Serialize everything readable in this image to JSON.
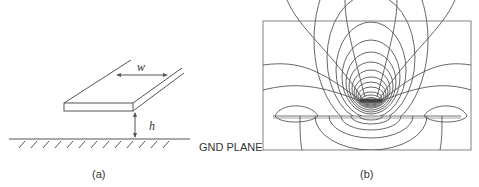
{
  "figure": {
    "panel_a": {
      "caption": "(a)",
      "width_label": "w",
      "height_label": "h"
    },
    "panel_b": {
      "caption": "(b)",
      "ground_label": "GND PLANE"
    },
    "colors": {
      "line": "#555555",
      "background": "#ffffff"
    }
  }
}
